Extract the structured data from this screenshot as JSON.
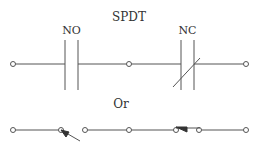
{
  "diagram": {
    "title": "SPDT",
    "contacts": [
      {
        "label": "NO",
        "type": "normally-open"
      },
      {
        "label": "NC",
        "type": "normally-closed"
      }
    ],
    "separator": "Or",
    "colors": {
      "line": "#555555",
      "text": "#333333",
      "background": "#ffffff"
    }
  }
}
